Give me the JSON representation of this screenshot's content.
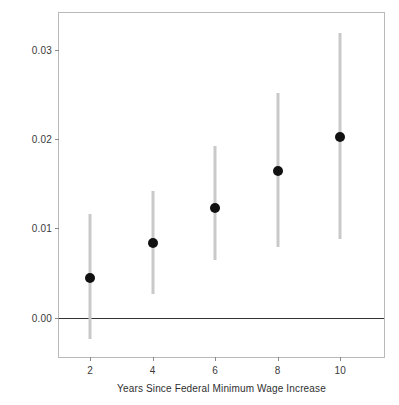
{
  "chart_data": {
    "type": "scatter",
    "title": "",
    "xlabel": "Years Since Federal Minimum Wage Increase",
    "ylabel": "Effect of Initiative on State Min. Wage Increase",
    "x": [
      2,
      4,
      6,
      8,
      10
    ],
    "values": [
      0.0044,
      0.0084,
      0.0123,
      0.0164,
      0.0202
    ],
    "ci_lower": [
      -0.0024,
      0.0027,
      0.0064,
      0.0079,
      0.0088
    ],
    "ci_upper": [
      0.0116,
      0.0142,
      0.0192,
      0.0251,
      0.0319
    ],
    "xticks": [
      2,
      4,
      6,
      8,
      10
    ],
    "xtick_labels": [
      "2",
      "4",
      "6",
      "8",
      "10"
    ],
    "yticks": [
      0.0,
      0.01,
      0.02,
      0.03
    ],
    "ytick_labels": [
      "0.00",
      "0.01",
      "0.02",
      "0.03"
    ],
    "xlim": [
      1.0,
      11.4
    ],
    "ylim": [
      -0.0044,
      0.0341
    ],
    "grid": false,
    "legend": null,
    "reference_line": {
      "y": 0.0,
      "color": "#333333"
    },
    "point_color": "#111111",
    "errorbar_color": "#c9c9c9",
    "frame_color": "#b9b9b9",
    "background": "#ffffff"
  }
}
